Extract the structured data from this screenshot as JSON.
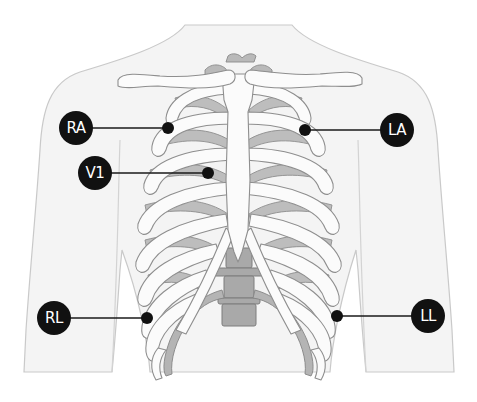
{
  "figure": {
    "colors": {
      "background": "#ffffff",
      "skin": "#f4f4f4",
      "skin_outline": "#c9c9c9",
      "bone_outline": "#8e8e8e",
      "cartilage": "#b9b9b9",
      "electrode": "#111111",
      "label_text": "#ffffff"
    }
  },
  "electrodes": [
    {
      "id": "RA",
      "label": "RA",
      "badge": {
        "cx": 76,
        "cy": 128,
        "r": 17
      },
      "dot": {
        "cx": 168,
        "cy": 128,
        "r": 6
      }
    },
    {
      "id": "V1",
      "label": "V1",
      "badge": {
        "cx": 95,
        "cy": 173,
        "r": 17
      },
      "dot": {
        "cx": 208,
        "cy": 173,
        "r": 6
      }
    },
    {
      "id": "LA",
      "label": "LA",
      "badge": {
        "cx": 397,
        "cy": 130,
        "r": 17
      },
      "dot": {
        "cx": 305,
        "cy": 130,
        "r": 6
      }
    },
    {
      "id": "RL",
      "label": "RL",
      "badge": {
        "cx": 54,
        "cy": 318,
        "r": 17
      },
      "dot": {
        "cx": 147,
        "cy": 318,
        "r": 6
      }
    },
    {
      "id": "LL",
      "label": "LL",
      "badge": {
        "cx": 428,
        "cy": 316,
        "r": 17
      },
      "dot": {
        "cx": 337,
        "cy": 316,
        "r": 6
      }
    }
  ]
}
